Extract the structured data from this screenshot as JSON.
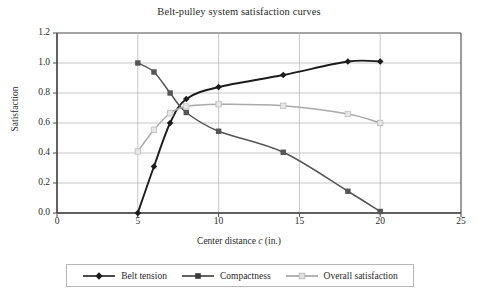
{
  "chart_data": {
    "type": "line",
    "title": "Belt-pulley system satisfaction curves",
    "xlabel": "Center distance c (in.)",
    "ylabel": "Satisfaction",
    "xlim": [
      0,
      25
    ],
    "ylim": [
      0.0,
      1.2
    ],
    "xticks": [
      "0",
      "5",
      "10",
      "15",
      "20",
      "25"
    ],
    "yticks": [
      "0.0",
      "0.2",
      "0.4",
      "0.6",
      "0.8",
      "1.0",
      "1.2"
    ],
    "grid": "horizontal-and-vertical",
    "legend_position": "bottom",
    "series": [
      {
        "name": "Belt tension",
        "color": "#1c1c1c",
        "marker": "diamond",
        "x": [
          5,
          6,
          7,
          8,
          10,
          14,
          18,
          20
        ],
        "values": [
          0.0,
          0.31,
          0.6,
          0.76,
          0.84,
          0.92,
          1.01,
          1.01
        ]
      },
      {
        "name": "Compactness",
        "color": "#555555",
        "marker": "square",
        "x": [
          5,
          6,
          7,
          8,
          10,
          14,
          18,
          20
        ],
        "values": [
          1.0,
          0.94,
          0.8,
          0.67,
          0.545,
          0.405,
          0.145,
          0.01
        ]
      },
      {
        "name": "Overall satisfaction",
        "color": "#aaaaaa",
        "marker": "square-open",
        "x": [
          5,
          6,
          7,
          8,
          10,
          14,
          18,
          20
        ],
        "values": [
          0.41,
          0.555,
          0.665,
          0.71,
          0.725,
          0.715,
          0.66,
          0.6
        ]
      }
    ]
  },
  "legend": {
    "items": [
      {
        "label": "Belt tension"
      },
      {
        "label": "Compactness"
      },
      {
        "label": "Overall satisfaction"
      }
    ]
  },
  "axis": {
    "x_label_prefix": "Center distance ",
    "x_label_var": "c",
    "x_label_suffix": " (in.)"
  }
}
